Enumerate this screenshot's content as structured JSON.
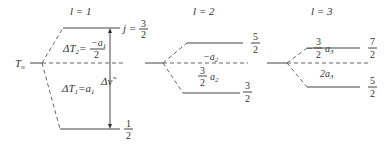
{
  "diagram": {
    "term_label": "T",
    "term_sub": "n",
    "groups": [
      {
        "l_label": "l = 1",
        "upper_j": {
          "num": "3",
          "den": "2",
          "prefix": "j ="
        },
        "lower_j": {
          "num": "1",
          "den": "2"
        },
        "upper_shift": {
          "lhs": "ΔT",
          "lhs_sub": "2",
          "eq": "=",
          "num": "−a",
          "num_sub": "1",
          "den": "2"
        },
        "lower_shift": {
          "lhs": "ΔT",
          "lhs_sub": "1",
          "eq": "=a",
          "sub": "1"
        },
        "interval_label": "Δν̃"
      },
      {
        "l_label": "l = 2",
        "upper_j": {
          "num": "5",
          "den": "2"
        },
        "lower_j": {
          "num": "3",
          "den": "2"
        },
        "upper_shift": {
          "text": "−a",
          "sub": "2"
        },
        "lower_shift": {
          "num": "3",
          "den": "2",
          "text": "a",
          "sub": "2"
        }
      },
      {
        "l_label": "l = 3",
        "upper_j": {
          "num": "7",
          "den": "2"
        },
        "lower_j": {
          "num": "5",
          "den": "2"
        },
        "upper_shift": {
          "sign": "−",
          "num": "3",
          "den": "2",
          "text": "a",
          "sub": "3"
        },
        "lower_shift": {
          "text": "2a",
          "sub": "3"
        }
      }
    ]
  }
}
